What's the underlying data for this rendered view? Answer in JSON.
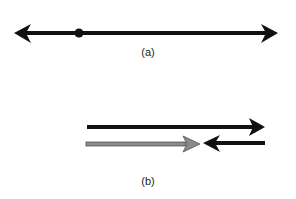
{
  "diagram": {
    "panel_a": {
      "label": "(a)",
      "elements": [
        "double-headed line",
        "point on line"
      ]
    },
    "panel_b": {
      "label": "(b)",
      "elements": [
        "black arrow pointing right",
        "gray arrow pointing right",
        "black arrow pointing left"
      ]
    },
    "colors": {
      "line": "#111111",
      "gray_arrow": "#8a8a8a",
      "gray_arrow_outline": "#555555"
    }
  }
}
